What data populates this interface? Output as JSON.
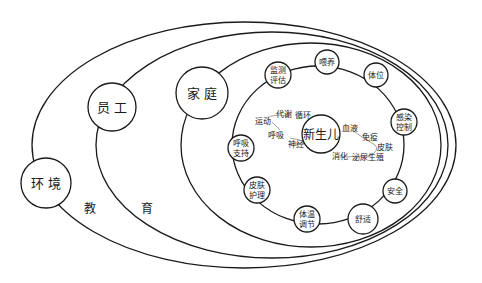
{
  "diagram": {
    "outer_layers": [
      {
        "id": "environment",
        "label": "环 境"
      },
      {
        "id": "staff",
        "label": "员 工"
      },
      {
        "id": "family",
        "label": "家 庭"
      }
    ],
    "education": {
      "label_1": "教",
      "label_2": "育"
    },
    "center": {
      "label": "新生儿"
    },
    "care_ring": [
      {
        "id": "monitoring",
        "line1": "监测",
        "line2": "评估"
      },
      {
        "id": "feeding",
        "line1": "喂养"
      },
      {
        "id": "positioning",
        "line1": "体位"
      },
      {
        "id": "infection-control",
        "line1": "感染",
        "line2": "控制"
      },
      {
        "id": "safety",
        "line1": "安全"
      },
      {
        "id": "comfort",
        "line1": "舒适"
      },
      {
        "id": "thermoregulation",
        "line1": "体温",
        "line2": "调节"
      },
      {
        "id": "skin-care",
        "line1": "皮肤",
        "line2": "护理"
      },
      {
        "id": "respiratory-support",
        "line1": "呼吸",
        "line2": "支持"
      }
    ],
    "body_systems": {
      "exercise": "运动",
      "metabolism": "代谢",
      "circulation": "循环",
      "respiration": "呼吸",
      "nerve": "神经",
      "blood": "血液",
      "immunity": "免疫",
      "skin": "皮肤",
      "digestion": "消化",
      "urogenital": "泌尿生殖"
    },
    "colors": {
      "stroke": "#1a1a1a",
      "background": "#ffffff"
    }
  }
}
